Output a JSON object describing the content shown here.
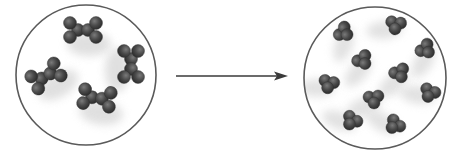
{
  "diagram": {
    "type": "molecular-transformation",
    "colors": {
      "background": "#ffffff",
      "circle_stroke": "#5a5a5a",
      "atom_fill": "#4a4a4a",
      "atom_highlight": "#6e6e6e",
      "shadow": "#d8d8d8",
      "arrow": "#3a3a3a"
    },
    "before": {
      "label": "",
      "circle": {
        "cx": 86,
        "cy": 75,
        "r": 70
      },
      "molecule_shape": "six-atom bone-shaped molecule",
      "molecules": [
        {
          "x": 83,
          "y": 30,
          "angle": 0
        },
        {
          "x": 46,
          "y": 76,
          "angle": -30
        },
        {
          "x": 131,
          "y": 64,
          "angle": 90
        },
        {
          "x": 97,
          "y": 98,
          "angle": 8
        }
      ]
    },
    "arrow": {
      "x1": 176,
      "y1": 76,
      "x2": 288,
      "y2": 76
    },
    "after": {
      "label": "",
      "circle": {
        "cx": 375,
        "cy": 78,
        "r": 71
      },
      "molecule_shape": "three-atom cluster",
      "molecules": [
        {
          "x": 344,
          "y": 32,
          "angle": -50
        },
        {
          "x": 396,
          "y": 25,
          "angle": 15
        },
        {
          "x": 426,
          "y": 49,
          "angle": -40
        },
        {
          "x": 363,
          "y": 60,
          "angle": -30
        },
        {
          "x": 400,
          "y": 73,
          "angle": -20
        },
        {
          "x": 329,
          "y": 84,
          "angle": 20
        },
        {
          "x": 374,
          "y": 99,
          "angle": 0
        },
        {
          "x": 430,
          "y": 93,
          "angle": 30
        },
        {
          "x": 352,
          "y": 121,
          "angle": 40
        },
        {
          "x": 395,
          "y": 125,
          "angle": 50
        }
      ]
    }
  }
}
